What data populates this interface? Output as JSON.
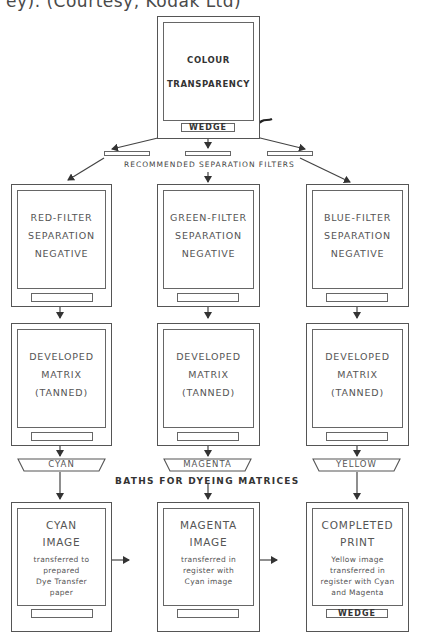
{
  "caption_clipped": "ey). (Courtesy, Kodak Ltd)",
  "source": {
    "title_line1": "COLOUR",
    "title_line2": "TRANSPARENCY",
    "wedge_label": "WEDGE"
  },
  "filters_label": "RECOMMENDED SEPARATION FILTERS",
  "negatives": [
    {
      "lines": [
        "RED-FILTER",
        "SEPARATION",
        "NEGATIVE"
      ]
    },
    {
      "lines": [
        "GREEN-FILTER",
        "SEPARATION",
        "NEGATIVE"
      ]
    },
    {
      "lines": [
        "BLUE-FILTER",
        "SEPARATION",
        "NEGATIVE"
      ]
    }
  ],
  "matrices": [
    {
      "lines": [
        "DEVELOPED",
        "MATRIX",
        "(TANNED)"
      ]
    },
    {
      "lines": [
        "DEVELOPED",
        "MATRIX",
        "(TANNED)"
      ]
    },
    {
      "lines": [
        "DEVELOPED",
        "MATRIX",
        "(TANNED)"
      ]
    }
  ],
  "baths": [
    "CYAN",
    "MAGENTA",
    "YELLOW"
  ],
  "baths_label": "BATHS FOR DYEING MATRICES",
  "images": [
    {
      "title": [
        "CYAN",
        "IMAGE"
      ],
      "desc": [
        "transferred to",
        "prepared",
        "Dye Transfer",
        "paper"
      ],
      "slot_label": ""
    },
    {
      "title": [
        "MAGENTA",
        "IMAGE"
      ],
      "desc": [
        "transferred in",
        "register with",
        "Cyan image"
      ],
      "slot_label": ""
    },
    {
      "title": [
        "COMPLETED",
        "PRINT"
      ],
      "desc": [
        "Yellow image",
        "transferred in",
        "register with Cyan",
        "and Magenta"
      ],
      "slot_label": "WEDGE"
    }
  ]
}
